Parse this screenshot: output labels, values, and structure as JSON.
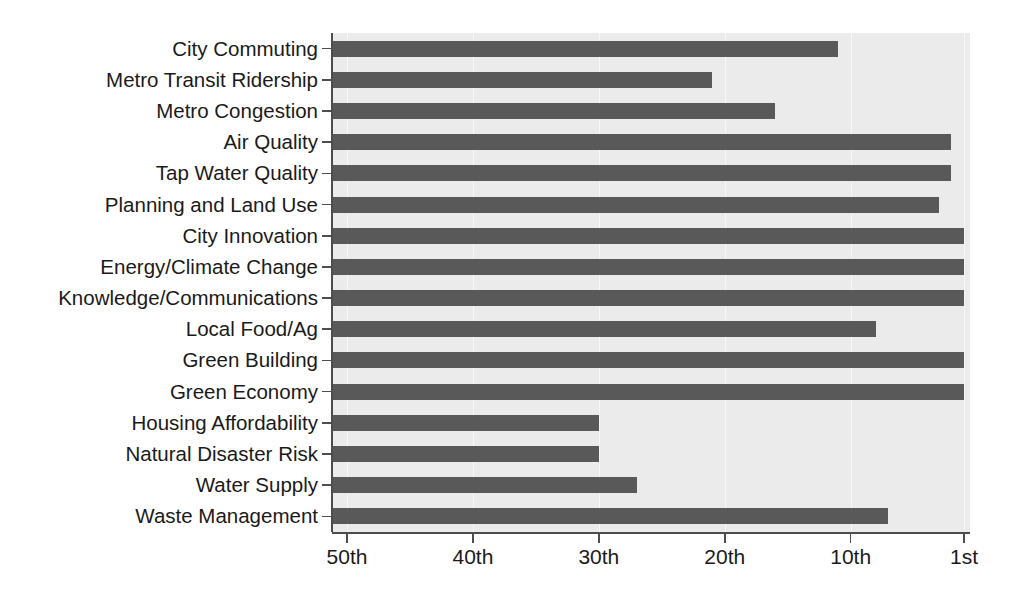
{
  "chart_data": {
    "type": "bar",
    "orientation": "horizontal",
    "title": "",
    "subtitle": "",
    "xlabel": "",
    "ylabel": "",
    "grid": true,
    "legend": null,
    "axis_direction": "reversed",
    "note": "Horizontal bar chart of city rankings; bars grow rightward toward 1st place. Axis runs 50th (left) to 1st (right).",
    "xlim": [
      50,
      1
    ],
    "xticks": [
      50,
      40,
      30,
      20,
      10,
      1
    ],
    "xtick_labels": [
      "50th",
      "40th",
      "30th",
      "20th",
      "10th",
      "1st"
    ],
    "categories": [
      "City Commuting",
      "Metro Transit Ridership",
      "Metro Congestion",
      "Air Quality",
      "Tap Water Quality",
      "Planning and Land Use",
      "City Innovation",
      "Energy/Climate Change",
      "Knowledge/Communications",
      "Local Food/Ag",
      "Green Building",
      "Green Economy",
      "Housing Affordability",
      "Natural Disaster Risk",
      "Water Supply",
      "Waste Management"
    ],
    "values": [
      11,
      21,
      16,
      2,
      2,
      3,
      1,
      1,
      1,
      8,
      1,
      1,
      30,
      30,
      27,
      7
    ],
    "value_labels": [
      "11th",
      "21st",
      "16th",
      "2nd",
      "2nd",
      "3rd",
      "1st",
      "1st",
      "1st",
      "8th",
      "1st",
      "1st",
      "30th",
      "30th",
      "27th",
      "7th"
    ],
    "colors": {
      "bar": "#595959",
      "panel_background": "#ebebeb",
      "figure_background": "#ffffff",
      "gridline": "#f7f7f7",
      "axis": "#4d4d4d",
      "text": "#1a1a1a"
    }
  }
}
